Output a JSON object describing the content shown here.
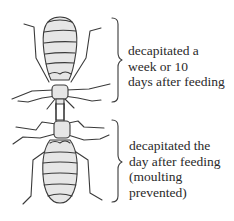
{
  "figure": {
    "colors": {
      "stroke": "#3a3a3a",
      "fill": "#e6e6e6",
      "background": "#ffffff"
    },
    "top_insect": {
      "caption_lines": [
        "decapitated a",
        "week or 10",
        "days after feeding"
      ]
    },
    "bottom_insect": {
      "caption_lines": [
        "decapitated the",
        "day after feeding",
        "(moulting",
        "prevented)"
      ]
    }
  }
}
